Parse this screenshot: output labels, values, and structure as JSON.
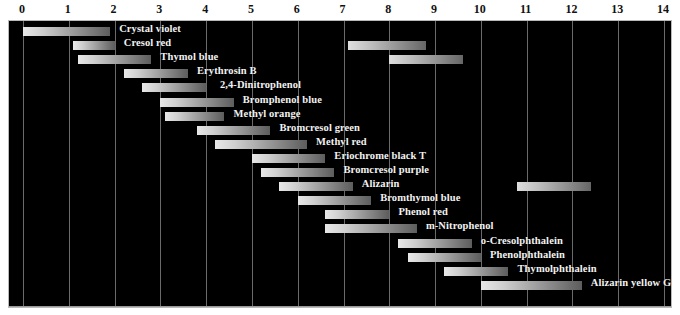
{
  "chart_data": {
    "type": "bar",
    "orientation": "horizontal",
    "xlabel": "pH",
    "ylabel": "",
    "xlim": [
      0,
      14
    ],
    "grid": true,
    "legend": "none",
    "background": "#000000",
    "bar_style": "grayscale-gradient",
    "x_ticks": [
      0,
      1,
      2,
      3,
      4,
      5,
      6,
      7,
      8,
      9,
      10,
      11,
      12,
      13,
      14
    ],
    "x_tick_labels": [
      "0",
      "1",
      "2",
      "3",
      "4",
      "5",
      "6",
      "7",
      "8",
      "9",
      "10",
      "11",
      "12",
      "13",
      "14"
    ],
    "categories": [
      "Crystal violet",
      "Cresol red",
      "Thymol blue",
      "Erythrosin B",
      "2,4-Dinitrophenol",
      "Bromphenol blue",
      "Methyl orange",
      "Bromcresol green",
      "Methyl red",
      "Eriochrome black T",
      "Bromcresol purple",
      "Alizarin",
      "Bromthymol blue",
      "Phenol red",
      "m-Nitrophenol",
      "o-Cresolphthalein",
      "Phenolphthalein",
      "Thymolphthalein",
      "Alizarin yellow GG"
    ],
    "rows": [
      {
        "name": "Crystal violet",
        "ranges": [
          [
            0.0,
            1.9
          ]
        ],
        "label_ph": 2.1,
        "label_align": "left"
      },
      {
        "name": "Cresol red",
        "ranges": [
          [
            1.1,
            2.0
          ],
          [
            7.1,
            8.8
          ]
        ],
        "label_ph": 2.2,
        "label_align": "left"
      },
      {
        "name": "Thymol blue",
        "ranges": [
          [
            1.2,
            2.8
          ],
          [
            8.0,
            9.6
          ]
        ],
        "label_ph": 3.0,
        "label_align": "left"
      },
      {
        "name": "Erythrosin B",
        "ranges": [
          [
            2.2,
            3.6
          ]
        ],
        "label_ph": 3.8,
        "label_align": "left"
      },
      {
        "name": "2,4-Dinitrophenol",
        "ranges": [
          [
            2.6,
            4.0
          ]
        ],
        "label_ph": 4.3,
        "label_align": "left"
      },
      {
        "name": "Bromphenol blue",
        "ranges": [
          [
            3.0,
            4.6
          ]
        ],
        "label_ph": 4.8,
        "label_align": "left"
      },
      {
        "name": "Methyl orange",
        "ranges": [
          [
            3.1,
            4.4
          ]
        ],
        "label_ph": 4.6,
        "label_align": "left"
      },
      {
        "name": "Bromcresol green",
        "ranges": [
          [
            3.8,
            5.4
          ]
        ],
        "label_ph": 5.6,
        "label_align": "left"
      },
      {
        "name": "Methyl red",
        "ranges": [
          [
            4.2,
            6.2
          ]
        ],
        "label_ph": 6.4,
        "label_align": "left"
      },
      {
        "name": "Eriochrome black T",
        "ranges": [
          [
            5.0,
            6.6
          ]
        ],
        "label_ph": 6.8,
        "label_align": "left"
      },
      {
        "name": "Bromcresol purple",
        "ranges": [
          [
            5.2,
            6.8
          ]
        ],
        "label_ph": 7.0,
        "label_align": "left"
      },
      {
        "name": "Alizarin",
        "ranges": [
          [
            5.6,
            7.2
          ],
          [
            10.8,
            12.4
          ]
        ],
        "label_ph": 7.4,
        "label_align": "left"
      },
      {
        "name": "Bromthymol blue",
        "ranges": [
          [
            6.0,
            7.6
          ]
        ],
        "label_ph": 7.8,
        "label_align": "left"
      },
      {
        "name": "Phenol red",
        "ranges": [
          [
            6.6,
            8.0
          ]
        ],
        "label_ph": 8.2,
        "label_align": "left"
      },
      {
        "name": "m-Nitrophenol",
        "ranges": [
          [
            6.6,
            8.6
          ]
        ],
        "label_ph": 8.8,
        "label_align": "left"
      },
      {
        "name": "o-Cresolphthalein",
        "ranges": [
          [
            8.2,
            9.8
          ]
        ],
        "label_ph": 10.0,
        "label_align": "left"
      },
      {
        "name": "Phenolphthalein",
        "ranges": [
          [
            8.4,
            10.0
          ]
        ],
        "label_ph": 10.2,
        "label_align": "left"
      },
      {
        "name": "Thymolphthalein",
        "ranges": [
          [
            9.2,
            10.6
          ]
        ],
        "label_ph": 10.8,
        "label_align": "left"
      },
      {
        "name": "Alizarin yellow GG",
        "ranges": [
          [
            10.0,
            12.2
          ]
        ],
        "label_ph": 12.4,
        "label_align": "left"
      }
    ]
  }
}
